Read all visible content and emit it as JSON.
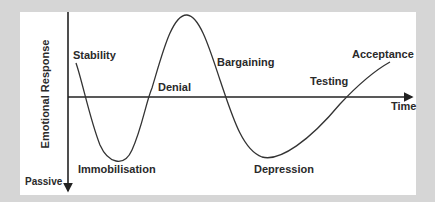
{
  "diagram": {
    "axes": {
      "y_label": "Emotional Response",
      "y_bottom_label": "Passive",
      "x_label": "Time"
    },
    "stages": [
      {
        "label": "Stability"
      },
      {
        "label": "Immobilisation"
      },
      {
        "label": "Denial"
      },
      {
        "label": "Bargaining"
      },
      {
        "label": "Depression"
      },
      {
        "label": "Testing"
      },
      {
        "label": "Acceptance"
      }
    ],
    "colors": {
      "background": "#d6d6d6",
      "panel": "#ffffff",
      "line": "#333333",
      "text": "#2a2a2a"
    }
  }
}
